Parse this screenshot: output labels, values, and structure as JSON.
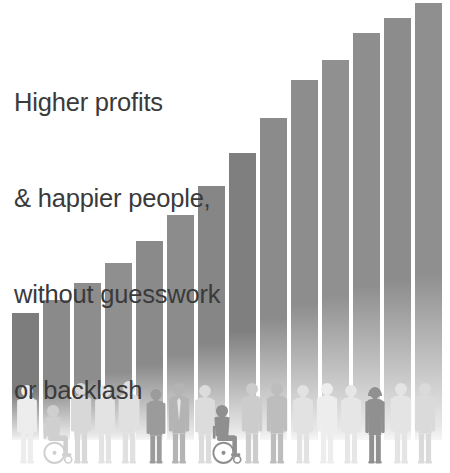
{
  "headline": {
    "lines": [
      "Higher profits",
      "& happier people,",
      "without guesswork",
      "or backlash"
    ],
    "color": "#3a3a3a"
  },
  "colors": {
    "background": "#ffffff",
    "bar_top": "#8a8a8a",
    "bar_bottom": "#e8e8e8",
    "bar_dark_accent": "#6f6f6f",
    "people_light": "#e4e4e4",
    "people_mid": "#c8c8c8",
    "people_dark": "#8e8e8e",
    "people_darkest": "#6a6a6a"
  },
  "chart_data": {
    "type": "bar",
    "title": "Higher profits & happier people, without guesswork or backlash",
    "xlabel": "",
    "ylabel": "",
    "grid": false,
    "legend": false,
    "axis_visible": false,
    "categories": [
      "1",
      "2",
      "3",
      "4",
      "5",
      "6",
      "7",
      "8",
      "9",
      "10",
      "11",
      "12",
      "13",
      "14"
    ],
    "values": [
      12,
      16,
      21,
      27,
      34,
      42,
      51,
      62,
      74,
      88,
      104,
      122,
      143,
      167
    ],
    "ylim": [
      0,
      175
    ],
    "bar_width_px": 27,
    "bar_gap_px": 4,
    "bar_left_px": [
      12,
      43,
      74,
      105,
      136,
      167,
      198,
      229,
      260,
      291,
      322,
      353,
      384,
      415
    ],
    "bar_top_px": [
      313,
      300,
      283,
      263,
      241,
      215,
      186,
      153,
      118,
      80,
      60,
      33,
      18,
      3
    ],
    "bar_shades": [
      "#7d7d7d",
      "#8a8a8a",
      "#8d8d8d",
      "#8f8f8f",
      "#8a8a8a",
      "#8c8c8c",
      "#868686",
      "#7f7f7f",
      "#8b8b8b",
      "#8d8d8d",
      "#909090",
      "#8e8e8e",
      "#8c8c8c",
      "#8f8f8f"
    ]
  },
  "people": {
    "count": 20,
    "description": "Row of diverse human silhouettes standing in front of the bars",
    "figures": [
      {
        "name": "standing-person-1",
        "x": 18,
        "h": 78,
        "tone": "#ededed",
        "type": "standing"
      },
      {
        "name": "wheelchair-user-1",
        "x": 43,
        "h": 58,
        "tone": "#cfcfcf",
        "type": "wheelchair"
      },
      {
        "name": "standing-person-2",
        "x": 72,
        "h": 80,
        "tone": "#d8d8d8",
        "type": "standing"
      },
      {
        "name": "standing-person-3",
        "x": 96,
        "h": 78,
        "tone": "#e3e3e3",
        "type": "standing"
      },
      {
        "name": "standing-person-4",
        "x": 120,
        "h": 82,
        "tone": "#e0e0e0",
        "type": "standing"
      },
      {
        "name": "standing-person-5",
        "x": 147,
        "h": 74,
        "tone": "#9b9b9b",
        "type": "standing"
      },
      {
        "name": "business-person-1",
        "x": 170,
        "h": 80,
        "tone": "#b4b4b4",
        "type": "suit"
      },
      {
        "name": "standing-person-6",
        "x": 196,
        "h": 78,
        "tone": "#dcdcdc",
        "type": "standing"
      },
      {
        "name": "wheelchair-user-2",
        "x": 212,
        "h": 58,
        "tone": "#8f8f8f",
        "type": "wheelchair"
      },
      {
        "name": "standing-person-7",
        "x": 243,
        "h": 80,
        "tone": "#cccccc",
        "type": "standing"
      },
      {
        "name": "standing-person-8",
        "x": 268,
        "h": 80,
        "tone": "#bdbdbd",
        "type": "standing"
      },
      {
        "name": "standing-person-9",
        "x": 294,
        "h": 78,
        "tone": "#e2e2e2",
        "type": "standing"
      },
      {
        "name": "standing-person-10",
        "x": 318,
        "h": 80,
        "tone": "#ededed",
        "type": "standing"
      },
      {
        "name": "standing-person-11",
        "x": 342,
        "h": 78,
        "tone": "#e6e6e6",
        "type": "standing"
      },
      {
        "name": "hoodie-person-1",
        "x": 366,
        "h": 76,
        "tone": "#909090",
        "type": "hoodie"
      },
      {
        "name": "standing-person-12",
        "x": 392,
        "h": 80,
        "tone": "#e4e4e4",
        "type": "standing"
      },
      {
        "name": "standing-person-13",
        "x": 416,
        "h": 80,
        "tone": "#dadada",
        "type": "standing"
      }
    ]
  }
}
